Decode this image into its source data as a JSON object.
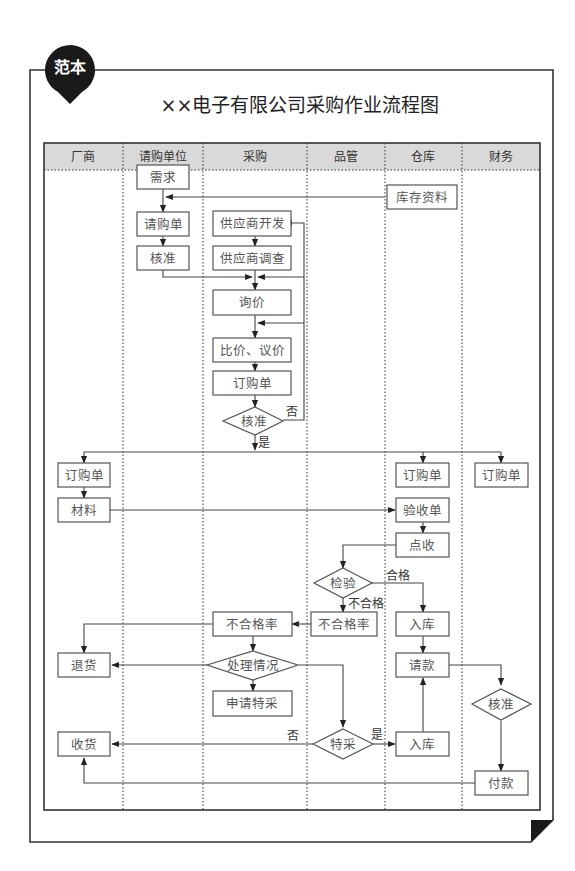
{
  "badge": {
    "label": "范本"
  },
  "title": "××电子有限公司采购作业流程图",
  "lanes": [
    {
      "label": "厂商"
    },
    {
      "label": "请购单位"
    },
    {
      "label": "采购"
    },
    {
      "label": "品管"
    },
    {
      "label": "仓库"
    },
    {
      "label": "财务"
    }
  ],
  "nodes": {
    "demand": "需求",
    "requisition": "请购单",
    "approve_req": "核准",
    "inventory_data": "库存资料",
    "supplier_dev": "供应商开发",
    "supplier_survey": "供应商调查",
    "inquiry": "询价",
    "compare_negotiate": "比价、议价",
    "purchase_order": "订购单",
    "approve_po": "核准",
    "vendor_po": "订购单",
    "warehouse_po": "订购单",
    "finance_po": "订购单",
    "material": "材料",
    "receiving_slip": "验收单",
    "count_receive": "点收",
    "inspection": "检验",
    "qc_reject_rate": "不合格率",
    "purchase_reject_rate": "不合格率",
    "return_goods": "退货",
    "handling": "处理情况",
    "apply_special": "申请特采",
    "special_accept": "特采",
    "store_1": "入库",
    "request_payment": "请款",
    "approve_payment": "核准",
    "store_2": "入库",
    "receive_goods": "收货",
    "payment": "付款"
  },
  "edge_labels": {
    "no_po": "否",
    "yes_po": "是",
    "pass": "合格",
    "fail": "不合格",
    "no_special": "否",
    "yes_special": "是"
  },
  "colors": {
    "header_bg": "#d9d9d9",
    "badge": "#1a1a1a",
    "line": "#444444",
    "node_text": "#555555"
  }
}
